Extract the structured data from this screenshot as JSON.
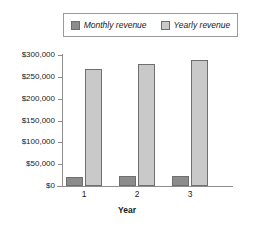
{
  "chart_data": {
    "type": "bar",
    "title": "",
    "xlabel": "Year",
    "ylabel": "",
    "categories": [
      "1",
      "2",
      "3"
    ],
    "series": [
      {
        "name": "Monthly revenue",
        "values": [
          21000,
          22000,
          22500
        ],
        "color": "#8c8c8c"
      },
      {
        "name": "Yearly revenue",
        "values": [
          268000,
          279000,
          288000
        ],
        "color": "#c9c9c9"
      }
    ],
    "ylim": [
      0,
      300000
    ],
    "ytick_values": [
      0,
      50000,
      100000,
      150000,
      200000,
      250000,
      300000
    ],
    "ytick_labels": [
      "$0",
      "$50,000",
      "$100,000",
      "$150,000",
      "$200,000",
      "$250,000",
      "$300,000"
    ],
    "grid": false,
    "legend_position": "top"
  },
  "legend": {
    "entries": [
      {
        "label": "Monthly revenue",
        "swatch_color": "#8c8c8c"
      },
      {
        "label": "Yearly revenue",
        "swatch_color": "#c9c9c9"
      }
    ]
  },
  "axes": {
    "x_title": "Year",
    "x_labels": [
      "1",
      "2",
      "3"
    ],
    "y_labels": [
      "$300,000",
      "$250,000",
      "$200,000",
      "$150,000",
      "$100,000",
      "$50,000",
      "$0"
    ]
  },
  "colors": {
    "monthly": "#8c8c8c",
    "yearly": "#c9c9c9",
    "axis": "#8d8d8d",
    "border": "#6f6f6f",
    "text": "#1a1a1a",
    "background": "#ffffff"
  }
}
